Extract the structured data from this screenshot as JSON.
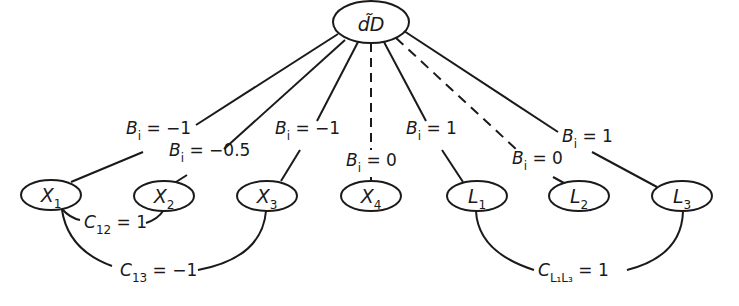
{
  "diagram": {
    "root": {
      "id": "dD",
      "label": "d̃D",
      "x": 371,
      "y": 22
    },
    "nodes": [
      {
        "id": "X1",
        "base": "X",
        "sub": "1",
        "x": 51,
        "y": 195
      },
      {
        "id": "X2",
        "base": "X",
        "sub": "2",
        "x": 164,
        "y": 196
      },
      {
        "id": "X3",
        "base": "X",
        "sub": "3",
        "x": 267,
        "y": 196
      },
      {
        "id": "X4",
        "base": "X",
        "sub": "4",
        "x": 371,
        "y": 196
      },
      {
        "id": "L1",
        "base": "L",
        "sub": "1",
        "x": 477,
        "y": 196
      },
      {
        "id": "L2",
        "base": "L",
        "sub": "2",
        "x": 579,
        "y": 196
      },
      {
        "id": "L3",
        "base": "L",
        "sub": "3",
        "x": 682,
        "y": 196
      }
    ],
    "edges": [
      {
        "to": "X1",
        "style": "solid",
        "label_var": "B",
        "label_sub": "i",
        "label_val": "= −1",
        "lx": 126,
        "ly": 130
      },
      {
        "to": "X2",
        "style": "solid",
        "label_var": "B",
        "label_sub": "i",
        "label_val": "= −0.5",
        "lx": 169,
        "ly": 148
      },
      {
        "to": "X3",
        "style": "solid",
        "label_var": "B",
        "label_sub": "i",
        "label_val": "= −1",
        "lx": 275,
        "ly": 130
      },
      {
        "to": "X4",
        "style": "dashed",
        "label_var": "B",
        "label_sub": "i",
        "label_val": "= 0",
        "lx": 346,
        "ly": 157
      },
      {
        "to": "L1",
        "style": "solid",
        "label_var": "B",
        "label_sub": "i",
        "label_val": "= 1",
        "lx": 406,
        "ly": 130
      },
      {
        "to": "L2",
        "style": "dashed",
        "label_var": "B",
        "label_sub": "i",
        "label_val": "= 0",
        "lx": 512,
        "ly": 148
      },
      {
        "to": "L3",
        "style": "solid",
        "label_var": "B",
        "label_sub": "i",
        "label_val": "= 1",
        "lx": 562,
        "ly": 130
      }
    ],
    "correlations": [
      {
        "between": [
          "X1",
          "X2"
        ],
        "var": "C",
        "sub": "12",
        "val": "= 1",
        "lx": 83,
        "ly": 217
      },
      {
        "between": [
          "X1",
          "X3"
        ],
        "var": "C",
        "sub": "13",
        "val": "= −1",
        "lx": 120,
        "ly": 266
      },
      {
        "between": [
          "L1",
          "L3"
        ],
        "var": "C",
        "sub": "L₁L₃",
        "val": "= 1",
        "lx": 538,
        "ly": 266
      }
    ]
  }
}
